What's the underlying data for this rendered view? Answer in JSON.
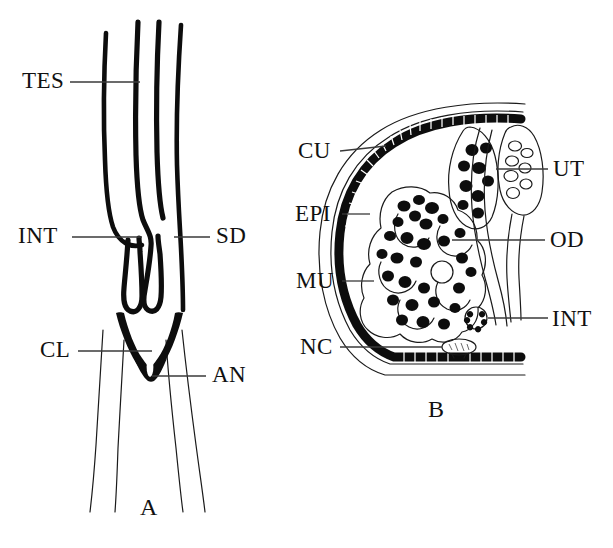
{
  "figure": {
    "background_color": "#ffffff",
    "ink_color": "#0d0d0d"
  },
  "panels": [
    {
      "id": "A",
      "letter": "A",
      "caption": "A",
      "description": "Longitudinal view of posterior region showing testis, intestine, sperm duct, cloaca and anus",
      "labels": [
        {
          "key": "TES",
          "text": "TES",
          "meaning": "testis",
          "x": 22,
          "y": 88,
          "leader": {
            "x1": 70,
            "y1": 82,
            "x2": 140,
            "y2": 82
          }
        },
        {
          "key": "INT",
          "text": "INT",
          "meaning": "intestine",
          "x": 18,
          "y": 243,
          "leader": {
            "x1": 72,
            "y1": 237,
            "x2": 140,
            "y2": 237
          }
        },
        {
          "key": "SD",
          "text": "SD",
          "meaning": "sperm duct",
          "x": 216,
          "y": 243,
          "leader": {
            "x1": 175,
            "y1": 237,
            "x2": 210,
            "y2": 237
          }
        },
        {
          "key": "CL",
          "text": "CL",
          "meaning": "cloaca",
          "x": 40,
          "y": 357,
          "leader": {
            "x1": 78,
            "y1": 351,
            "x2": 152,
            "y2": 351
          }
        },
        {
          "key": "AN",
          "text": "AN",
          "meaning": "anus",
          "x": 212,
          "y": 382,
          "leader": {
            "x1": 152,
            "y1": 376,
            "x2": 206,
            "y2": 376
          }
        }
      ]
    },
    {
      "id": "B",
      "letter": "B",
      "caption": "B",
      "description": "Transverse cross-section showing cuticle, epidermis, muscle, nerve cord, uterus, oviduct and intestine",
      "labels": [
        {
          "key": "CU",
          "text": "CU",
          "meaning": "cuticle",
          "x": 298,
          "y": 158,
          "leader": {
            "x1": 340,
            "y1": 151,
            "x2": 382,
            "y2": 151
          }
        },
        {
          "key": "EPI",
          "text": "EPI",
          "meaning": "epidermis",
          "x": 295,
          "y": 221,
          "leader": {
            "x1": 342,
            "y1": 214,
            "x2": 368,
            "y2": 214
          }
        },
        {
          "key": "MU",
          "text": "MU",
          "meaning": "muscle",
          "x": 296,
          "y": 287,
          "leader": {
            "x1": 342,
            "y1": 281,
            "x2": 372,
            "y2": 281
          }
        },
        {
          "key": "NC",
          "text": "NC",
          "meaning": "nerve cord",
          "x": 300,
          "y": 353,
          "leader": {
            "x1": 340,
            "y1": 347,
            "x2": 438,
            "y2": 347
          }
        },
        {
          "key": "UT",
          "text": "UT",
          "meaning": "uterus",
          "x": 553,
          "y": 175,
          "leader": {
            "x1": 495,
            "y1": 169,
            "x2": 548,
            "y2": 169
          }
        },
        {
          "key": "OD",
          "text": "OD",
          "meaning": "oviduct",
          "x": 550,
          "y": 247,
          "leader": {
            "x1": 452,
            "y1": 240,
            "x2": 545,
            "y2": 240
          }
        },
        {
          "key": "INT",
          "text": "INT",
          "meaning": "intestine",
          "x": 552,
          "y": 325,
          "leader": {
            "x1": 492,
            "y1": 318,
            "x2": 548,
            "y2": 318
          }
        }
      ]
    }
  ],
  "panel_letters": [
    {
      "text": "A",
      "x": 140,
      "y": 515
    },
    {
      "text": "B",
      "x": 428,
      "y": 417
    }
  ],
  "legend_keys": {
    "TES": "testis",
    "INT": "intestine",
    "SD": "sperm duct",
    "CL": "cloaca",
    "AN": "anus",
    "CU": "cuticle",
    "EPI": "epidermis",
    "MU": "muscle",
    "NC": "nerve cord",
    "UT": "uterus",
    "OD": "oviduct"
  }
}
